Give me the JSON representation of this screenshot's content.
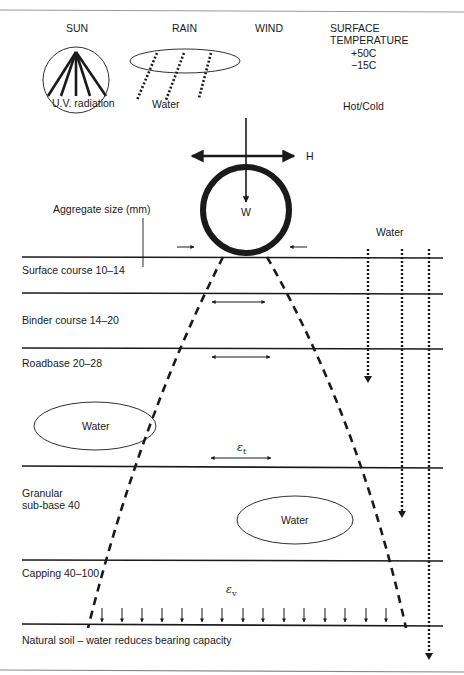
{
  "diagram": {
    "type": "pavement cross-section",
    "environment": {
      "sun": {
        "title": "SUN",
        "caption": "U.V. radiation"
      },
      "rain": {
        "title": "RAIN",
        "caption": "Water"
      },
      "wind": {
        "title": "WIND"
      },
      "temperature": {
        "title_line1": "SURFACE",
        "title_line2": "TEMPERATURE",
        "high": "+50C",
        "low": "−15C",
        "caption": "Hot/Cold"
      }
    },
    "wheel": {
      "horizontal_force": "H",
      "vertical_load": "W"
    },
    "aggregate_label": "Aggregate size (mm)",
    "water_label_right": "Water",
    "layers": [
      {
        "name": "Surface course 10–14"
      },
      {
        "name": "Binder course 14–20"
      },
      {
        "name": "Roadbase 20–28"
      },
      {
        "name": "Granular",
        "name2": "sub-base 40"
      },
      {
        "name": "Capping 40–100"
      },
      {
        "name": "Natural soil – water reduces bearing capacity"
      }
    ],
    "water_pockets": [
      {
        "label": "Water"
      },
      {
        "label": "Water"
      }
    ],
    "strains": {
      "tensile": "ε",
      "tensile_sub": "t",
      "vertical": "ε",
      "vertical_sub": "v"
    },
    "colors": {
      "line": "#1a1a1a",
      "background": "#ffffff",
      "border": "#888888"
    }
  }
}
